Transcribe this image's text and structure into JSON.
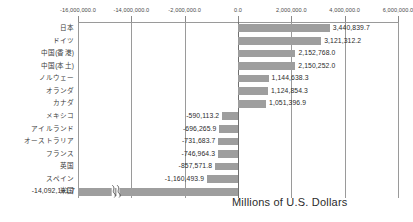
{
  "chart_data": {
    "type": "bar",
    "orientation": "horizontal",
    "title": "",
    "subtitle": "",
    "xlabel": "Millions of U.S. Dollars",
    "ylabel": "",
    "grid": true,
    "legend": false,
    "legend_position": "none",
    "axis_break": {
      "present": true,
      "between": [
        -14000000.0,
        -2000000.0
      ],
      "note": "zigzag break drawn across the 米国 bar"
    },
    "xticks": [
      {
        "label": "-16,000,000.0",
        "value": -16000000.0,
        "pos": 0.0
      },
      {
        "label": "-14,000,000.0",
        "value": -14000000.0,
        "pos": 0.16666
      },
      {
        "label": "-2,000,000.0",
        "value": -2000000.0,
        "pos": 0.33333
      },
      {
        "label": "0.0",
        "value": 0.0,
        "pos": 0.5
      },
      {
        "label": "2,000,000.0",
        "value": 2000000.0,
        "pos": 0.66666
      },
      {
        "label": "4,000,000.0",
        "value": 4000000.0,
        "pos": 0.83333
      },
      {
        "label": "6,000,000.0",
        "value": 6000000.0,
        "pos": 1.0
      }
    ],
    "categories": [
      "日本",
      "ドイツ",
      "中国(香港)",
      "中国(本土)",
      "ノルウェー",
      "オランダ",
      "カナダ",
      "メキシコ",
      "アイルランド",
      "オーストラリア",
      "フランス",
      "英国",
      "スペイン",
      "米国"
    ],
    "values": [
      3440839.7,
      3121312.2,
      2152768.0,
      2150252.0,
      1144638.3,
      1124854.3,
      1051396.9,
      -590113.2,
      -696265.9,
      -731683.7,
      -746964.3,
      -857571.8,
      -1160493.9,
      -14092101.7
    ],
    "value_labels": [
      "3,440,839.7",
      "3,121,312.2",
      "2,152,768.0",
      "2,150,252.0",
      "1,144,638.3",
      "1,124,854.3",
      "1,051,396.9",
      "-590,113.2",
      "-696,265.9",
      "-731,683.7",
      "-746,964.3",
      "-857,571.8",
      "-1,160,493.9",
      "-14,092,101.7"
    ],
    "bar_color": "#9e9e9e",
    "axis_color": "#9a9a9a",
    "text_color": "#2b2b2b"
  }
}
